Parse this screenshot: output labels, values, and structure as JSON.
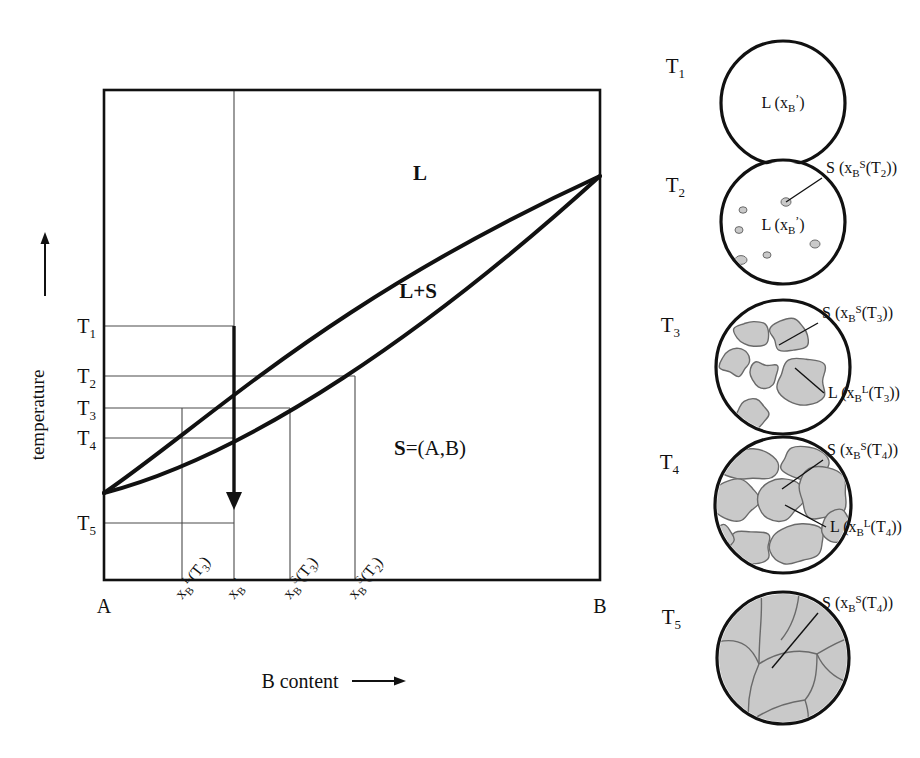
{
  "figure": {
    "kind": "binary-isomorphous-phase-diagram-with-microstructures",
    "width": 920,
    "height": 758,
    "background": "#ffffff",
    "ink": "#111111",
    "grain_fill": "#c9c9c9",
    "grain_stroke": "#6a6a6a",
    "thin_line": "#4a4a4a"
  },
  "diagram": {
    "axis_y_label": "temperature",
    "axis_y_arrow": "up-arrow",
    "axis_y_arrow_glyph": "↑",
    "axis_x_label": "B content",
    "axis_x_arrow": "right-arrow",
    "axis_x_arrow_glyph": "⟶",
    "corner_left": "A",
    "corner_right": "B",
    "region_liquid": "L",
    "region_two_phase": "L+S",
    "region_solid_bold": "S",
    "region_solid_rest": "=(A,B)",
    "temperature_ticks": [
      {
        "id": "T1",
        "base": "T",
        "sub": "1",
        "y": 326
      },
      {
        "id": "T2",
        "base": "T",
        "sub": "2",
        "y": 376
      },
      {
        "id": "T3",
        "base": "T",
        "sub": "3",
        "y": 408
      },
      {
        "id": "T4",
        "base": "T",
        "sub": "4",
        "y": 438
      },
      {
        "id": "T5",
        "base": "T",
        "sub": "5",
        "y": 523
      }
    ],
    "composition_ticks": [
      {
        "id": "xBL_T3",
        "x": 182,
        "base": "x",
        "sub": "B",
        "sup": "L",
        "suffix": "(T",
        "suffix_sub": "3",
        "suffix_end": ")"
      },
      {
        "id": "xB_prime",
        "x": 234,
        "base": "x",
        "sub": "B",
        "sup": "’",
        "suffix": "",
        "suffix_sub": "",
        "suffix_end": ""
      },
      {
        "id": "xBS_T3",
        "x": 290,
        "base": "x",
        "sub": "B",
        "sup": "S",
        "suffix": "(T",
        "suffix_sub": "3",
        "suffix_end": ")"
      },
      {
        "id": "xBS_T2",
        "x": 355,
        "base": "x",
        "sub": "B",
        "sup": "S",
        "suffix": "(T",
        "suffix_sub": "2",
        "suffix_end": ")"
      }
    ],
    "cooling_arrow": {
      "x": 234,
      "y_from": 326,
      "y_to": 508,
      "label": "cooling-path-arrow"
    },
    "plot_frame": {
      "left": 104,
      "right": 600,
      "top": 90,
      "bottom": 580
    }
  },
  "micrographs": [
    {
      "id": "T1",
      "temp_base": "T",
      "temp_sub": "1",
      "cx": 783,
      "cy": 103,
      "r": 62,
      "state": "all-liquid",
      "inner_labels": [
        {
          "id": "liquid",
          "base": "L (x",
          "sub": "B",
          "sup": "’",
          "tail": ")",
          "x": 783,
          "y": 108,
          "anchor": "middle"
        }
      ],
      "callouts": []
    },
    {
      "id": "T2",
      "temp_base": "T",
      "temp_sub": "2",
      "cx": 783,
      "cy": 222,
      "r": 62,
      "state": "liquid-with-first-nuclei",
      "inner_labels": [
        {
          "id": "liquid",
          "base": "L (x",
          "sub": "B",
          "sup": "’",
          "tail": ")",
          "x": 783,
          "y": 230,
          "anchor": "middle"
        }
      ],
      "callouts": [
        {
          "id": "solid",
          "base": "S (x",
          "sub": "B",
          "sup": "S",
          "tail": "(T",
          "tail_sub": "2",
          "tail_end": "))",
          "x": 826,
          "y": 173,
          "anchor": "start",
          "line": [
            822,
            178,
            786,
            202
          ]
        }
      ]
    },
    {
      "id": "T3",
      "temp_base": "T",
      "temp_sub": "3",
      "cx": 783,
      "cy": 367,
      "r": 67,
      "state": "solid-grains-in-liquid-matrix",
      "inner_labels": [],
      "callouts": [
        {
          "id": "solid",
          "base": "S (x",
          "sub": "B",
          "sup": "S",
          "tail": "(T",
          "tail_sub": "3",
          "tail_end": "))",
          "x": 822,
          "y": 318,
          "anchor": "start",
          "line": [
            818,
            323,
            779,
            345
          ]
        },
        {
          "id": "liquid",
          "base": "L (x",
          "sub": "B",
          "sup": "L",
          "tail": "(T",
          "tail_sub": "3",
          "tail_end": "))",
          "x": 828,
          "y": 398,
          "anchor": "start",
          "line": [
            824,
            393,
            795,
            368
          ]
        }
      ]
    },
    {
      "id": "T4",
      "temp_base": "T",
      "temp_sub": "4",
      "cx": 783,
      "cy": 505,
      "r": 68,
      "state": "solid-grains-with-thin-liquid-films",
      "inner_labels": [],
      "callouts": [
        {
          "id": "solid",
          "base": "S (x",
          "sub": "B",
          "sup": "S",
          "tail": "(T",
          "tail_sub": "4",
          "tail_end": "))",
          "x": 827,
          "y": 455,
          "anchor": "start",
          "line": [
            823,
            460,
            782,
            489
          ]
        },
        {
          "id": "liquid",
          "base": "L (x",
          "sub": "B",
          "sup": "L",
          "tail": "(T",
          "tail_sub": "4",
          "tail_end": "))",
          "x": 830,
          "y": 532,
          "anchor": "start",
          "line": [
            826,
            527,
            785,
            505
          ]
        }
      ]
    },
    {
      "id": "T5",
      "temp_base": "T",
      "temp_sub": "5",
      "cx": 783,
      "cy": 658,
      "r": 66,
      "state": "fully-solid-polycrystal",
      "inner_labels": [],
      "callouts": [
        {
          "id": "solid",
          "base": "S (x",
          "sub": "B",
          "sup": "S",
          "tail": "(T",
          "tail_sub": "4",
          "tail_end": "))",
          "x": 822,
          "y": 608,
          "anchor": "start",
          "line": [
            818,
            613,
            772,
            668
          ]
        }
      ]
    }
  ]
}
